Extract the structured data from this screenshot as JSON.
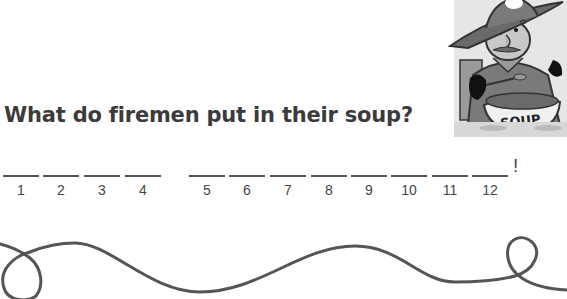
{
  "worksheet": {
    "question": "What do firemen put in their soup?",
    "answer_suffix": "!",
    "blanks": [
      {
        "number": "1",
        "value": ""
      },
      {
        "number": "2",
        "value": ""
      },
      {
        "number": "3",
        "value": ""
      },
      {
        "number": "4",
        "value": ""
      },
      {
        "number": "5",
        "value": ""
      },
      {
        "number": "6",
        "value": ""
      },
      {
        "number": "7",
        "value": ""
      },
      {
        "number": "8",
        "value": ""
      },
      {
        "number": "9",
        "value": ""
      },
      {
        "number": "10",
        "value": ""
      },
      {
        "number": "11",
        "value": ""
      },
      {
        "number": "12",
        "value": ""
      }
    ],
    "illustration": {
      "subject": "fireman-eating-soup",
      "bowl_label": "SOUP"
    }
  },
  "colors": {
    "text": "#3b3b3b",
    "line": "#555555",
    "squiggle": "#555555"
  }
}
